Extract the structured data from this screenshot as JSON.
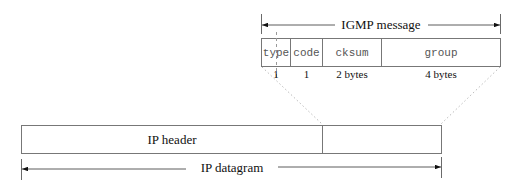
{
  "igmp_message": {
    "label": "IGMP message",
    "fields": [
      {
        "name": "type",
        "size": "1"
      },
      {
        "name": "code",
        "size": "1"
      },
      {
        "name": "cksum",
        "size": "2 bytes"
      },
      {
        "name": "group",
        "size": "4 bytes"
      }
    ]
  },
  "ip_datagram": {
    "label": "IP datagram",
    "header_label": "IP header",
    "payload_label": ""
  }
}
